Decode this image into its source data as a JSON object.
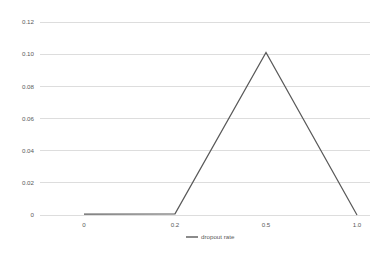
{
  "chart_data": {
    "type": "line",
    "title": "",
    "xlabel": "",
    "ylabel": "",
    "categories": [
      "0",
      "0.2",
      "0.5",
      "1.0"
    ],
    "x": [
      0,
      0.2,
      0.5,
      1.0
    ],
    "series": [
      {
        "name": "dropout rate",
        "values": [
          0.0005,
          0.0007,
          0.101,
          0.0
        ]
      }
    ],
    "legend": [
      "dropout rate"
    ],
    "legend_position": "bottom",
    "grid": true,
    "grid_axis": "y",
    "ylim": [
      0,
      0.12
    ],
    "yticks": [
      0,
      0.02,
      0.04,
      0.06,
      0.08,
      0.1,
      0.12
    ],
    "ytick_labels": [
      "0",
      "0.02",
      "0.04",
      "0.06",
      "0.08",
      "0.10",
      "0.12"
    ],
    "xtick_labels": [
      "0",
      "0.2",
      "0.5",
      "1.0"
    ],
    "colors": {
      "series": "#595959",
      "grid": "#d4d4d4",
      "text": "#5a5a5a",
      "background": "#ffffff"
    }
  }
}
